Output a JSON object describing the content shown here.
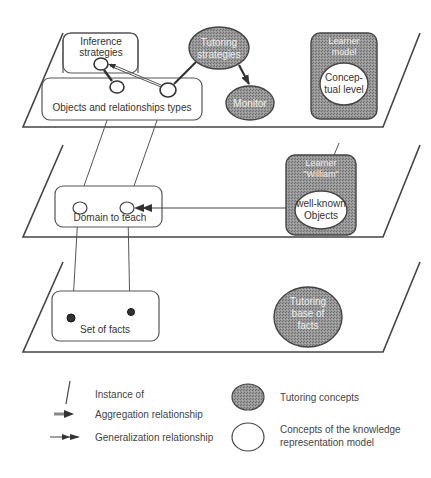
{
  "colors": {
    "tutoring_fill": "#8a8a8a",
    "tutoring_stroke": "#444444",
    "line": "#444444",
    "background": "#ffffff"
  },
  "planes": [
    {
      "name": "top-plane",
      "nodes": {
        "inference_strategies": {
          "line1": "Inference",
          "line2": "strategies"
        },
        "objects_relationships": {
          "label": "Objects  and  relationships types"
        },
        "tutoring_strategies": {
          "line1": "Tutoring",
          "line2": "strategies"
        },
        "monitor": {
          "label": "Monitor"
        },
        "learner_model": {
          "line1": "Learner",
          "line2": "model"
        },
        "conceptual_level": {
          "line1": "Concep-",
          "line2": "tual level"
        }
      }
    },
    {
      "name": "middle-plane",
      "nodes": {
        "domain_to_teach": {
          "label": "Domain to teach"
        },
        "learner_william": {
          "line1": "Learner",
          "line2": "\"William\""
        },
        "well_known_objects": {
          "line1": "well-known",
          "line2": "Objects"
        }
      }
    },
    {
      "name": "bottom-plane",
      "nodes": {
        "set_of_facts": {
          "label": "Set of facts"
        },
        "tutoring_base_of_facts": {
          "line1": "Tutoring",
          "line2": "base of",
          "line3": "facts"
        }
      }
    }
  ],
  "legend": {
    "instance_of": "Instance of",
    "aggregation": "Aggregation relationship",
    "generalization": "Generalization relationship",
    "tutoring_concepts": "Tutoring concepts",
    "krm_concepts_line1": "Concepts of the knowledge",
    "krm_concepts_line2": "representation model"
  }
}
